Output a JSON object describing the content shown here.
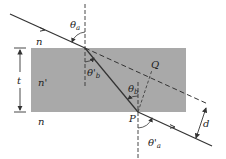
{
  "diagram": {
    "colors": {
      "background": "#ffffff",
      "slab": "#a9a9a9",
      "line": "#333333"
    },
    "labels": {
      "n_top": "n",
      "n_slab": "n'",
      "n_bottom": "n",
      "thickness": "t",
      "theta_a": "θ",
      "theta_a_sub": "a",
      "theta_b_prime": "θ'",
      "theta_b_prime_sub": "b",
      "theta_b": "θ",
      "theta_b_sub": "b",
      "theta_a_prime": "θ'",
      "theta_a_prime_sub": "a",
      "point_P": "P",
      "point_Q": "Q",
      "displacement": "d"
    }
  }
}
